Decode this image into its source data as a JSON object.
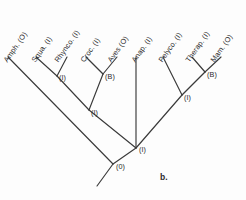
{
  "figure": {
    "caption": "b.",
    "caption_x": 160,
    "caption_y": 172,
    "background_color": "#fdfdfd",
    "line_color": "#3a3a3a",
    "text_color": "#2b2b2b",
    "width": 246,
    "height": 200
  },
  "chart_data": {
    "type": "diagram",
    "diagram_type": "cladogram",
    "title": "b.",
    "taxa": [
      {
        "label": "Amph. (O)",
        "state": "O",
        "name": "Amph.",
        "tip_x": 8,
        "tip_y": 57,
        "label_x": 9,
        "label_y": 55
      },
      {
        "label": "Squa. (I)",
        "state": "I",
        "name": "Squa.",
        "tip_x": 36,
        "tip_y": 57,
        "label_x": 37,
        "label_y": 55
      },
      {
        "label": "Rhynco. (I)",
        "state": "I",
        "name": "Rhynco.",
        "tip_x": 67,
        "tip_y": 57,
        "label_x": 60,
        "label_y": 55
      },
      {
        "label": "Croc. (I)",
        "state": "I",
        "name": "Croc.",
        "tip_x": 86,
        "tip_y": 57,
        "label_x": 86,
        "label_y": 55
      },
      {
        "label": "Aves (O)",
        "state": "O",
        "name": "Aves",
        "tip_x": 117,
        "tip_y": 57,
        "label_x": 113,
        "label_y": 55
      },
      {
        "label": "Anap. (I)",
        "state": "I",
        "name": "Anap.",
        "tip_x": 136,
        "tip_y": 57,
        "label_x": 137,
        "label_y": 55
      },
      {
        "label": "Pelyco. (I)",
        "state": "I",
        "name": "Pelyco.",
        "tip_x": 163,
        "tip_y": 57,
        "label_x": 164,
        "label_y": 55
      },
      {
        "label": "Therap. (I)",
        "state": "I",
        "name": "Therap.",
        "tip_x": 192,
        "tip_y": 57,
        "label_x": 191,
        "label_y": 55
      },
      {
        "label": "Mam. (O)",
        "state": "O",
        "name": "Mam.",
        "tip_x": 221,
        "tip_y": 57,
        "label_x": 216,
        "label_y": 55
      }
    ],
    "nodes": [
      {
        "id": "n-squa-rhynco",
        "label": "(I)",
        "x": 57,
        "y": 76,
        "label_x": 59,
        "label_y": 73
      },
      {
        "id": "n-croc-aves",
        "label": "(B)",
        "x": 103,
        "y": 74,
        "label_x": 105,
        "label_y": 72
      },
      {
        "id": "n-sauria",
        "label": "(I)",
        "x": 89,
        "y": 110,
        "label_x": 91,
        "label_y": 108
      },
      {
        "id": "n-therap-mam",
        "label": "(B)",
        "x": 205,
        "y": 72,
        "label_x": 207,
        "label_y": 70
      },
      {
        "id": "n-synapsida",
        "label": "(I)",
        "x": 182,
        "y": 95,
        "label_x": 184,
        "label_y": 93
      },
      {
        "id": "n-amniota",
        "label": "(I)",
        "x": 136,
        "y": 148,
        "label_x": 139,
        "label_y": 145
      },
      {
        "id": "n-root",
        "label": "(0)",
        "x": 113,
        "y": 164,
        "label_x": 116,
        "label_y": 162
      }
    ],
    "branches": [
      {
        "name": "amph-branch",
        "x1": 8,
        "y1": 57,
        "x2": 113,
        "y2": 164
      },
      {
        "name": "squa-branch",
        "x1": 36,
        "y1": 57,
        "x2": 57,
        "y2": 76
      },
      {
        "name": "rhynco-branch",
        "x1": 67,
        "y1": 57,
        "x2": 57,
        "y2": 76
      },
      {
        "name": "squa-rhynco-to-sauria",
        "x1": 57,
        "y1": 76,
        "x2": 89,
        "y2": 110
      },
      {
        "name": "croc-branch",
        "x1": 86,
        "y1": 57,
        "x2": 103,
        "y2": 74
      },
      {
        "name": "aves-branch",
        "x1": 117,
        "y1": 57,
        "x2": 103,
        "y2": 74
      },
      {
        "name": "croc-aves-to-sauria",
        "x1": 103,
        "y1": 74,
        "x2": 89,
        "y2": 110
      },
      {
        "name": "sauria-to-amniota",
        "x1": 89,
        "y1": 110,
        "x2": 136,
        "y2": 148
      },
      {
        "name": "anap-branch",
        "x1": 136,
        "y1": 57,
        "x2": 136,
        "y2": 148
      },
      {
        "name": "pelyco-branch",
        "x1": 163,
        "y1": 57,
        "x2": 182,
        "y2": 95
      },
      {
        "name": "therap-branch",
        "x1": 192,
        "y1": 57,
        "x2": 205,
        "y2": 72
      },
      {
        "name": "mam-branch",
        "x1": 221,
        "y1": 57,
        "x2": 205,
        "y2": 72
      },
      {
        "name": "therap-mam-to-synap",
        "x1": 205,
        "y1": 72,
        "x2": 182,
        "y2": 95
      },
      {
        "name": "synap-to-amniota",
        "x1": 182,
        "y1": 95,
        "x2": 136,
        "y2": 148
      },
      {
        "name": "amniota-to-root",
        "x1": 136,
        "y1": 148,
        "x2": 113,
        "y2": 164
      },
      {
        "name": "root-tail",
        "x1": 113,
        "y1": 164,
        "x2": 97,
        "y2": 186
      }
    ],
    "label_rotation_deg": -55,
    "legend_entries": [],
    "xlabel": "",
    "ylabel": ""
  }
}
